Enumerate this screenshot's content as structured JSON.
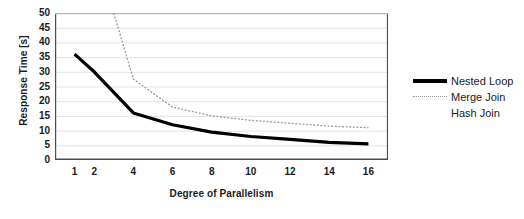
{
  "chart_data": {
    "type": "line",
    "title": "",
    "xlabel": "Degree of Parallelism",
    "ylabel": "Response Time [s]",
    "xlim": [
      0,
      17
    ],
    "ylim": [
      0,
      50
    ],
    "xticks": [
      1,
      2,
      4,
      6,
      8,
      10,
      12,
      14,
      16
    ],
    "xtick_labels": [
      "1",
      "2",
      "4",
      "6",
      "8",
      "10",
      "12",
      "14",
      "16"
    ],
    "yticks": [
      0,
      5,
      10,
      15,
      20,
      25,
      30,
      35,
      40,
      45,
      50
    ],
    "ytick_labels": [
      "0",
      "5",
      "10",
      "15",
      "20",
      "25",
      "30",
      "35",
      "40",
      "45",
      "50"
    ],
    "grid": "horizontal",
    "legend_position": "right",
    "series": [
      {
        "name": "Nested Loop",
        "color": "#000000",
        "style": "solid",
        "width": 3.2,
        "x": [
          1,
          2,
          4,
          6,
          8,
          10,
          12,
          14,
          16
        ],
        "values": [
          36,
          30,
          16,
          12,
          9.5,
          8,
          7,
          6,
          5.5
        ]
      },
      {
        "name": "Merge Join",
        "color": "#9a9a9a",
        "style": "dotted",
        "width": 1.3,
        "x": [
          3,
          4,
          6,
          8,
          10,
          12,
          14,
          16
        ],
        "values": [
          50,
          27.5,
          18,
          15,
          13.5,
          12.5,
          11.5,
          11
        ],
        "note": "clipped at top of axis below x=3"
      },
      {
        "name": "Hash Join",
        "color": "#ffffff",
        "style": "solid",
        "width": 1.3,
        "x": [],
        "values": [],
        "note": "legend entry only; line not visible in plot"
      }
    ]
  },
  "axes": {
    "y_title": "Response Time [s]",
    "x_title": "Degree of Parallelism"
  },
  "legend": {
    "items": [
      {
        "label": "Nested Loop"
      },
      {
        "label": "Merge Join"
      },
      {
        "label": "Hash Join"
      }
    ]
  },
  "colors": {
    "series_primary": "#000000",
    "series_secondary": "#9a9a9a",
    "series_tertiary": "#ffffff",
    "grid": "#e3e3e3",
    "axis": "#4d4d4d",
    "text": "#1a1a1a",
    "background": "#ffffff"
  }
}
